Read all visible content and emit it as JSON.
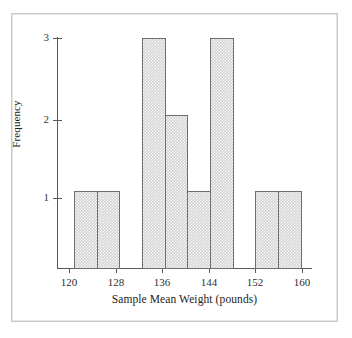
{
  "figure": {
    "frame_color": "#c9c9c9",
    "background": "#ffffff",
    "bar_fill": "#d3d3d3",
    "bar_edge": "#6f6f6f",
    "axis_color": "#5a5a5a"
  },
  "axes": {
    "x_title": "Sample Mean Weight (pounds)",
    "y_title": "Frequency",
    "x_ticks": [
      "120",
      "128",
      "136",
      "144",
      "152",
      "160"
    ],
    "y_ticks": [
      "1",
      "2",
      "3"
    ]
  },
  "chart_data": {
    "type": "bar",
    "title": "",
    "subtitle": "",
    "xlabel": "Sample Mean Weight (pounds)",
    "ylabel": "Frequency",
    "xlim": [
      117,
      162
    ],
    "ylim": [
      0,
      3
    ],
    "xtick_values": [
      120,
      128,
      136,
      144,
      152,
      160
    ],
    "xtick_labels": [
      "120",
      "128",
      "136",
      "144",
      "152",
      "160"
    ],
    "ytick_values": [
      1,
      2,
      3
    ],
    "ytick_labels": [
      "1",
      "2",
      "3"
    ],
    "grid": false,
    "legend": null,
    "bin_width": 4,
    "bins": [
      {
        "label": "120-124",
        "x_start": 120,
        "x_end": 124,
        "frequency": 1
      },
      {
        "label": "124-128",
        "x_start": 124,
        "x_end": 128,
        "frequency": 1
      },
      {
        "label": "128-132",
        "x_start": 128,
        "x_end": 132,
        "frequency": 0
      },
      {
        "label": "132-136",
        "x_start": 132,
        "x_end": 136,
        "frequency": 3
      },
      {
        "label": "136-140",
        "x_start": 136,
        "x_end": 140,
        "frequency": 2
      },
      {
        "label": "140-144",
        "x_start": 140,
        "x_end": 144,
        "frequency": 1
      },
      {
        "label": "144-148",
        "x_start": 144,
        "x_end": 148,
        "frequency": 3
      },
      {
        "label": "148-152",
        "x_start": 148,
        "x_end": 152,
        "frequency": 0
      },
      {
        "label": "152-156",
        "x_start": 152,
        "x_end": 156,
        "frequency": 1
      },
      {
        "label": "156-160",
        "x_start": 156,
        "x_end": 160,
        "frequency": 1
      }
    ],
    "categories": [
      "120-124",
      "124-128",
      "128-132",
      "132-136",
      "136-140",
      "140-144",
      "144-148",
      "148-152",
      "152-156",
      "156-160"
    ],
    "values": [
      1,
      1,
      0,
      3,
      2,
      1,
      3,
      0,
      1,
      1
    ],
    "total_frequency": 13
  }
}
